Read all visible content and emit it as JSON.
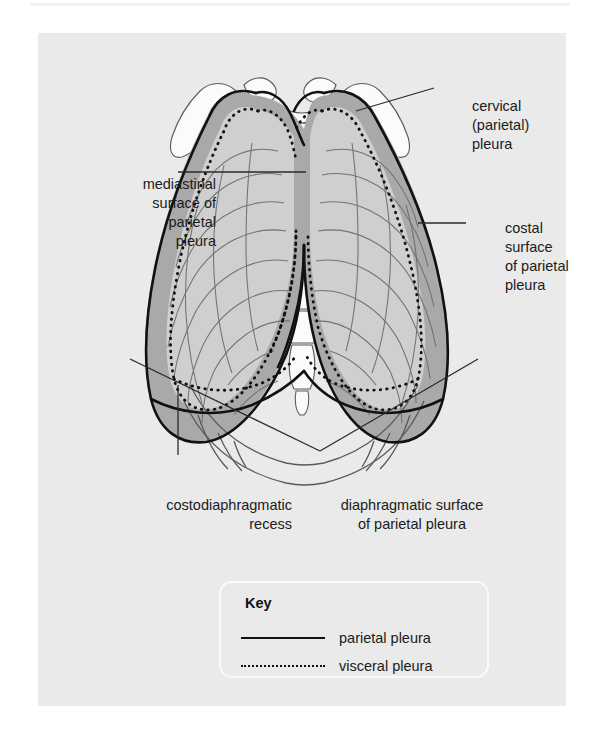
{
  "figure": {
    "background_color": "#eaeaea",
    "labels": {
      "cervical": "cervical\n(parietal)\npleura",
      "mediastinal": "mediastinal\nsurface of\nparietal\npleura",
      "costal": "costal\nsurface\nof parietal\npleura",
      "costodiaphragmatic_recess": "costodiaphragmatic\nrecess",
      "diaphragmatic_surface": "diaphragmatic surface\nof parietal pleura"
    }
  },
  "key": {
    "title": "Key",
    "entries": [
      {
        "style": "solid-line",
        "label": "parietal pleura"
      },
      {
        "style": "dotted-line",
        "label": "visceral pleura"
      }
    ]
  },
  "colors": {
    "panel_background": "#eaeaea",
    "lung_field": "#cfcfcf",
    "pleural_recess": "#a9a9a9",
    "bone_fill": "#fcfcfc",
    "outline": "#4a4a4a",
    "parietal_line": "#111111",
    "visceral_line": "#111111",
    "text": "#1b1b1b",
    "key_border": "#fafafa"
  }
}
